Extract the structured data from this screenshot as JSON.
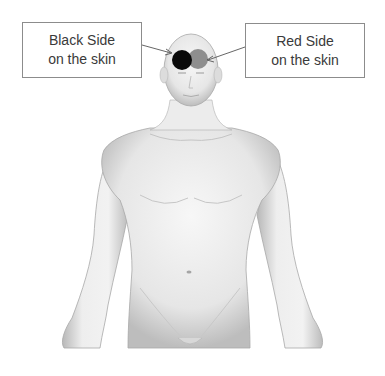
{
  "diagram": {
    "callouts": [
      {
        "id": "black",
        "line1": "Black Side",
        "line2": "on the skin"
      },
      {
        "id": "red",
        "line1": "Red Side",
        "line2": "on the skin"
      }
    ],
    "markers": [
      {
        "id": "black-electrode",
        "color": "#0a0a0a"
      },
      {
        "id": "red-electrode",
        "color": "#8e8e8e"
      }
    ]
  }
}
